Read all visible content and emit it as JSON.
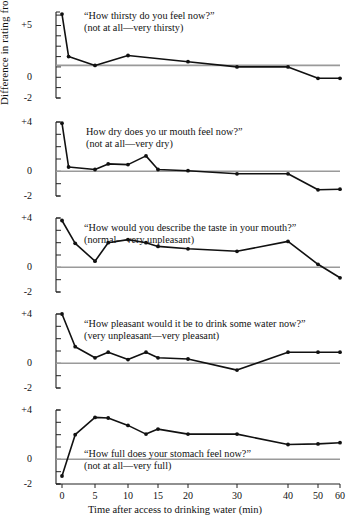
{
  "figure": {
    "ylabel": "Difference in rating from predeprivation value",
    "xlabel": "Time after access to drinking water (min)",
    "line_color": "#111111",
    "baseline_color": "#9a9a9a",
    "axis_color": "#222222"
  },
  "chart_data": {
    "type": "line",
    "title": "",
    "xlabel": "Time after access to drinking water (min)",
    "ylabel": "Difference in rating from predeprivation value",
    "xticks": [
      0,
      5,
      10,
      15,
      20,
      30,
      40,
      50,
      60
    ],
    "xlim": [
      0,
      60
    ],
    "grid": false,
    "legend": "none",
    "note": "Five stacked panels sharing one x axis; x spacing is compressed after 20 min. Each panel shows a baseline reference line.",
    "panels": [
      {
        "id": "thirsty",
        "question": "“How thirsty do you feel now?”",
        "anchors": "(not at all—very thirsty)",
        "yticks": [
          -2,
          0,
          5
        ],
        "ytick_labels": [
          "-2",
          "0",
          "+5"
        ],
        "ylim": [
          -2,
          6.3
        ],
        "baseline_value": 1.15,
        "x": [
          0,
          1,
          5,
          10,
          20,
          30,
          40,
          50,
          60
        ],
        "values": [
          6.1,
          2.0,
          1.15,
          2.1,
          1.5,
          1.0,
          1.0,
          -0.1,
          -0.1
        ]
      },
      {
        "id": "dry-mouth",
        "question": "How dry does yo  ur mouth feel now?”",
        "anchors": "(not at all—very dry)",
        "yticks": [
          -2,
          0,
          4
        ],
        "ytick_labels": [
          "-2",
          "0",
          "+4"
        ],
        "ylim": [
          -2,
          4
        ],
        "baseline_value": 0.0,
        "x": [
          0,
          1,
          5,
          7,
          10,
          13,
          15,
          20,
          30,
          40,
          50,
          60
        ],
        "values": [
          3.9,
          0.35,
          0.15,
          0.6,
          0.55,
          1.25,
          0.15,
          0.05,
          -0.2,
          -0.2,
          -1.5,
          -1.45
        ]
      },
      {
        "id": "taste",
        "question": "“How would you describe the taste in your mouth?”",
        "anchors": "(normal—very unpleasant)",
        "yticks": [
          -2,
          0,
          4
        ],
        "ytick_labels": [
          "-2",
          "0",
          "+4"
        ],
        "ylim": [
          -2,
          4
        ],
        "baseline_value": 0.0,
        "x": [
          0,
          2,
          5,
          7,
          10,
          13,
          15,
          20,
          30,
          40,
          50,
          60
        ],
        "values": [
          3.8,
          1.95,
          0.5,
          2.0,
          2.25,
          2.0,
          1.7,
          1.5,
          1.3,
          2.1,
          0.25,
          -0.85
        ]
      },
      {
        "id": "pleasant",
        "question": "“How pleasant would it be to drink some water now?”",
        "anchors": "(very unpleasant—very pleasant)",
        "yticks": [
          -2,
          0,
          4
        ],
        "ytick_labels": [
          "-2",
          "0",
          "+4"
        ],
        "ylim": [
          -2,
          4
        ],
        "baseline_value": 0.0,
        "x": [
          0,
          2,
          5,
          7,
          10,
          13,
          15,
          20,
          30,
          40,
          50,
          60
        ],
        "values": [
          4.0,
          1.35,
          0.45,
          0.9,
          0.3,
          0.9,
          0.45,
          0.35,
          -0.55,
          0.9,
          0.9,
          0.9
        ]
      },
      {
        "id": "stomach-full",
        "question": "“How full does your stomach feel now?”",
        "anchors": "(not at all—very full)",
        "yticks": [
          -2,
          0,
          4
        ],
        "ytick_labels": [
          "-2",
          "0",
          "+4"
        ],
        "ylim": [
          -2,
          4
        ],
        "baseline_value": 0.0,
        "x": [
          0,
          2,
          5,
          7,
          10,
          13,
          15,
          20,
          30,
          40,
          50,
          60
        ],
        "values": [
          -1.35,
          2.0,
          3.4,
          3.35,
          2.75,
          2.05,
          2.45,
          2.05,
          2.05,
          1.2,
          1.25,
          1.35
        ]
      }
    ]
  }
}
